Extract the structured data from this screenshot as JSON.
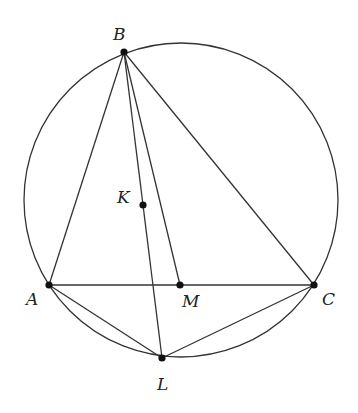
{
  "diagram": {
    "type": "geometry",
    "colors": {
      "stroke": "#333333",
      "point": "#111111",
      "label": "#222222",
      "background": "#ffffff"
    },
    "circle": {
      "cx": 181,
      "cy": 200,
      "r": 157
    },
    "points": {
      "B": {
        "label": "B",
        "x": 124,
        "y": 52,
        "lx": 113,
        "ly": 40
      },
      "K": {
        "label": "K",
        "x": 143,
        "y": 205,
        "lx": 117,
        "ly": 203
      },
      "A": {
        "label": "A",
        "x": 49,
        "y": 285,
        "lx": 26,
        "ly": 305
      },
      "M": {
        "label": "M",
        "x": 180,
        "y": 285,
        "lx": 182,
        "ly": 307
      },
      "C": {
        "label": "C",
        "x": 314,
        "y": 285,
        "lx": 322,
        "ly": 305
      },
      "L": {
        "label": "L",
        "x": 162,
        "y": 358,
        "lx": 157,
        "ly": 390
      }
    },
    "segments": [
      [
        "B",
        "A"
      ],
      [
        "B",
        "C"
      ],
      [
        "A",
        "C"
      ],
      [
        "B",
        "L"
      ],
      [
        "B",
        "M"
      ],
      [
        "A",
        "L"
      ],
      [
        "C",
        "L"
      ]
    ]
  }
}
